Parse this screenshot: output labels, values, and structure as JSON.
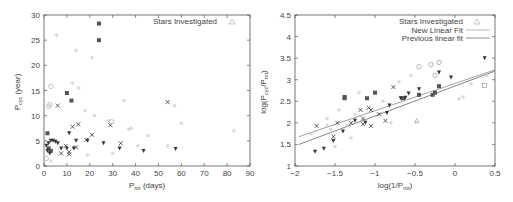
{
  "chart_data": [
    {
      "type": "scatter",
      "title": "",
      "xlabel": "P_rot (days)",
      "ylabel": "P_cyc (year)",
      "xlim": [
        0,
        90
      ],
      "ylim": [
        0,
        30
      ],
      "xticks": [
        "0",
        "10",
        "20",
        "30",
        "40",
        "50",
        "60",
        "70",
        "80",
        "90"
      ],
      "yticks": [
        "0",
        "5",
        "10",
        "15",
        "20",
        "25",
        "30"
      ],
      "grid": false,
      "legend": {
        "position": "top-right",
        "entries": [
          "Stars Investigated"
        ]
      },
      "series": [
        {
          "name": "filled squares (dark)",
          "marker": "square-filled",
          "color": "#555555",
          "points": [
            [
              24,
              28.3
            ],
            [
              24,
              25
            ],
            [
              10,
              14.5
            ],
            [
              12,
              13
            ],
            [
              1.5,
              6.5
            ],
            [
              2,
              3.5
            ],
            [
              3,
              3
            ]
          ]
        },
        {
          "name": "crosses",
          "marker": "x",
          "color": "#333333",
          "points": [
            [
              6,
              12
            ],
            [
              12.5,
              7.8
            ],
            [
              15,
              8.3
            ],
            [
              9.5,
              4
            ],
            [
              7.5,
              2.5
            ],
            [
              11,
              2.8
            ],
            [
              11,
              2.3
            ],
            [
              14,
              3.7
            ],
            [
              18.5,
              5.2
            ],
            [
              21,
              6.2
            ],
            [
              29,
              8.1
            ],
            [
              33.5,
              4.5
            ],
            [
              54,
              12.7
            ]
          ]
        },
        {
          "name": "filled down-triangles",
          "marker": "triangle-down-filled",
          "color": "#333333",
          "points": [
            [
              1,
              4
            ],
            [
              2,
              4.5
            ],
            [
              3,
              5
            ],
            [
              4,
              5
            ],
            [
              5,
              4.8
            ],
            [
              6,
              4.5
            ],
            [
              7.5,
              3.5
            ],
            [
              10,
              3.5
            ],
            [
              11,
              6.5
            ],
            [
              13,
              3.5
            ],
            [
              14,
              5
            ],
            [
              19,
              5
            ],
            [
              26,
              4.5
            ],
            [
              33,
              3.5
            ],
            [
              43.5,
              3
            ],
            [
              57.5,
              3.4
            ],
            [
              1.5,
              3
            ],
            [
              2.5,
              2.5
            ]
          ]
        },
        {
          "name": "open circles (light)",
          "marker": "circle-open",
          "color": "#aaaaaa",
          "points": [
            [
              3,
              15.8
            ],
            [
              2,
              11.8
            ],
            [
              2.5,
              12.2
            ],
            [
              1,
              1.5
            ],
            [
              29.5,
              8.8
            ]
          ]
        },
        {
          "name": "light markers (background)",
          "marker": "mixed-light",
          "color": "#cccccc",
          "points": [
            [
              14,
              23
            ],
            [
              21,
              21.5
            ],
            [
              12.5,
              16.5
            ],
            [
              15,
              15.5
            ],
            [
              5.5,
              26
            ],
            [
              37,
              7.3
            ],
            [
              38,
              7.5
            ],
            [
              41,
              4
            ],
            [
              45.5,
              6
            ],
            [
              60,
              8.5
            ],
            [
              83,
              7
            ],
            [
              57,
              12
            ],
            [
              54,
              4
            ],
            [
              30,
              2.5
            ],
            [
              22,
              10
            ],
            [
              19,
              2.2
            ],
            [
              3,
              1
            ],
            [
              35,
              13
            ],
            [
              18,
              11
            ],
            [
              28,
              9
            ]
          ]
        }
      ]
    },
    {
      "type": "scatter",
      "title": "",
      "xlabel": "log(1/P_rot)",
      "ylabel": "log(P_cyc/P_rot)",
      "xlim": [
        -2,
        0.5
      ],
      "ylim": [
        1,
        4.5
      ],
      "xticks": [
        "-2",
        "-1.5",
        "-1",
        "-0.5",
        "0",
        "0.5"
      ],
      "yticks": [
        "1",
        "1.5",
        "2",
        "2.5",
        "3",
        "3.5",
        "4",
        "4.5"
      ],
      "grid": false,
      "legend": {
        "position": "top-right",
        "entries": [
          "Stars Investigated",
          "New Linear Fit",
          "Previous linear fit"
        ]
      },
      "lines": [
        {
          "name": "New Linear Fit",
          "x": [
            -1.95,
            0.5
          ],
          "y": [
            1.68,
            3.23
          ],
          "color": "#888888"
        },
        {
          "name": "Previous linear fit",
          "x": [
            -1.95,
            0.5
          ],
          "y": [
            1.5,
            3.2
          ],
          "color": "#666666"
        }
      ],
      "series": [
        {
          "name": "filled squares (dark)",
          "marker": "square-filled",
          "color": "#555555",
          "points": [
            [
              -1.38,
              2.6
            ],
            [
              -1.38,
              2.57
            ],
            [
              -1.1,
              2.57
            ],
            [
              -1.0,
              2.7
            ],
            [
              -0.65,
              2.57
            ],
            [
              -0.45,
              2.65
            ],
            [
              -0.2,
              2.85
            ],
            [
              -0.25,
              2.7
            ],
            [
              -0.28,
              2.65
            ]
          ]
        },
        {
          "name": "crosses",
          "marker": "x",
          "color": "#333333",
          "points": [
            [
              -1.73,
              1.93
            ],
            [
              -1.47,
              2.0
            ],
            [
              -1.3,
              2.0
            ],
            [
              -1.18,
              2.3
            ],
            [
              -1.08,
              2.35
            ],
            [
              -1.05,
              2.3
            ],
            [
              -1.15,
              2.1
            ],
            [
              -1.15,
              1.97
            ],
            [
              -1.05,
              1.93
            ],
            [
              -0.95,
              2.2
            ],
            [
              -0.87,
              2.05
            ],
            [
              -0.77,
              2.83
            ],
            [
              -1.52,
              1.68
            ]
          ]
        },
        {
          "name": "filled down-triangles",
          "marker": "triangle-down-filled",
          "color": "#333333",
          "points": [
            [
              -1.75,
              1.33
            ],
            [
              -1.64,
              1.4
            ],
            [
              -1.52,
              1.58
            ],
            [
              -1.4,
              1.8
            ],
            [
              -1.25,
              2.05
            ],
            [
              -1.12,
              2.0
            ],
            [
              -0.85,
              2.23
            ],
            [
              -0.82,
              2.4
            ],
            [
              -0.68,
              2.57
            ],
            [
              -0.62,
              2.58
            ],
            [
              -0.58,
              2.68
            ],
            [
              -0.45,
              2.78
            ],
            [
              -0.2,
              3.17
            ],
            [
              -0.05,
              3.05
            ],
            [
              0.37,
              3.5
            ]
          ]
        },
        {
          "name": "open circles (light)",
          "marker": "circle-open",
          "color": "#999999",
          "points": [
            [
              -0.45,
              3.3
            ],
            [
              -0.3,
              3.35
            ],
            [
              -0.2,
              3.4
            ],
            [
              -0.25,
              3.1
            ]
          ]
        },
        {
          "name": "open triangle",
          "marker": "triangle-open",
          "color": "#999999",
          "points": [
            [
              -0.48,
              2.05
            ]
          ]
        },
        {
          "name": "open squares",
          "marker": "square-open",
          "color": "#999999",
          "points": [
            [
              0.37,
              2.87
            ]
          ]
        },
        {
          "name": "light markers (background)",
          "marker": "mixed-light",
          "color": "#cccccc",
          "points": [
            [
              -1.8,
              1.75
            ],
            [
              -1.6,
              1.95
            ],
            [
              -1.55,
              1.85
            ],
            [
              -1.5,
              1.45
            ],
            [
              -1.35,
              1.95
            ],
            [
              -1.3,
              1.65
            ],
            [
              -1.25,
              2.2
            ],
            [
              -1.2,
              2.7
            ],
            [
              -0.9,
              2.5
            ],
            [
              -0.7,
              2.95
            ],
            [
              -0.8,
              2.0
            ],
            [
              -0.55,
              3.1
            ],
            [
              0.05,
              2.55
            ],
            [
              0.1,
              2.6
            ],
            [
              0.2,
              2.9
            ],
            [
              0.4,
              3.1
            ],
            [
              -1.6,
              2.1
            ],
            [
              -1.45,
              2.3
            ]
          ]
        }
      ]
    }
  ],
  "left_plot": {
    "ylabel_main": "P",
    "ylabel_sub": "cyc",
    "ylabel_rest": " (year)",
    "xlabel_main": "P",
    "xlabel_sub": "rot",
    "xlabel_rest": " (days)",
    "legend_label": "Stars Investigated",
    "xticks": [
      "0",
      "10",
      "20",
      "30",
      "40",
      "50",
      "60",
      "70",
      "80",
      "90"
    ],
    "yticks": [
      "0",
      "5",
      "10",
      "15",
      "20",
      "25",
      "30"
    ]
  },
  "right_plot": {
    "ylabel_pre": "log(P",
    "ylabel_sub1": "cyc",
    "ylabel_mid": "/P",
    "ylabel_sub2": "rot",
    "ylabel_post": ")",
    "xlabel_pre": "log(1/P",
    "xlabel_sub": "rot",
    "xlabel_post": ")",
    "legend": [
      "Stars Investigated",
      "New Linear Fit",
      "Previous linear fit"
    ],
    "xticks": [
      "-2",
      "-1.5",
      "-1",
      "-0.5",
      "0",
      "0.5"
    ],
    "yticks": [
      "1",
      "1.5",
      "2",
      "2.5",
      "3",
      "3.5",
      "4",
      "4.5"
    ]
  }
}
